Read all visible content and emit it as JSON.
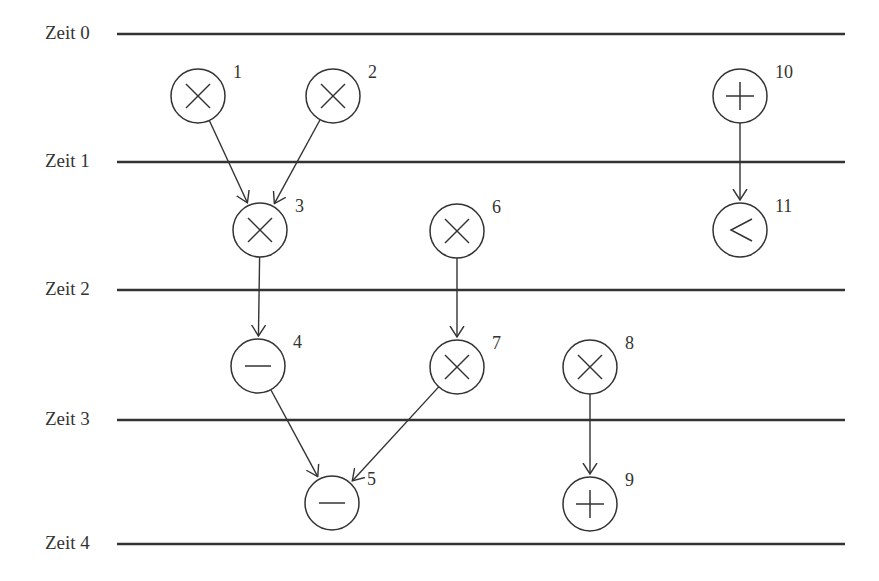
{
  "colors": {
    "line": "#333333",
    "background": "#ffffff"
  },
  "time_steps": [
    {
      "label": "Zeit 0",
      "y": 34
    },
    {
      "label": "Zeit 1",
      "y": 162
    },
    {
      "label": "Zeit 2",
      "y": 290
    },
    {
      "label": "Zeit 3",
      "y": 420
    },
    {
      "label": "Zeit 4",
      "y": 544
    }
  ],
  "line_extent": {
    "x1": 117,
    "x2": 845
  },
  "nodes": [
    {
      "id": "1",
      "op": "multiply",
      "x": 198,
      "y": 96
    },
    {
      "id": "2",
      "op": "multiply",
      "x": 333,
      "y": 96
    },
    {
      "id": "3",
      "op": "multiply",
      "x": 260,
      "y": 230
    },
    {
      "id": "4",
      "op": "subtract",
      "x": 258,
      "y": 366
    },
    {
      "id": "5",
      "op": "subtract",
      "x": 332,
      "y": 503
    },
    {
      "id": "6",
      "op": "multiply",
      "x": 457,
      "y": 231
    },
    {
      "id": "7",
      "op": "multiply",
      "x": 457,
      "y": 367
    },
    {
      "id": "8",
      "op": "multiply",
      "x": 590,
      "y": 367
    },
    {
      "id": "9",
      "op": "add",
      "x": 590,
      "y": 504
    },
    {
      "id": "10",
      "op": "add",
      "x": 740,
      "y": 96
    },
    {
      "id": "11",
      "op": "less-than",
      "x": 740,
      "y": 230
    }
  ],
  "edges": [
    [
      "1",
      "3"
    ],
    [
      "2",
      "3"
    ],
    [
      "3",
      "4"
    ],
    [
      "4",
      "5"
    ],
    [
      "6",
      "7"
    ],
    [
      "7",
      "5"
    ],
    [
      "8",
      "9"
    ],
    [
      "10",
      "11"
    ]
  ]
}
